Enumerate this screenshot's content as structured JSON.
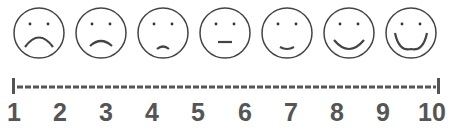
{
  "colors": {
    "stroke": "#444444",
    "line": "#555555",
    "numbers": "#555555",
    "background": "#ffffff"
  },
  "faces": [
    {
      "name": "very-sad-face",
      "mouth": "deep-frown"
    },
    {
      "name": "sad-face",
      "mouth": "frown"
    },
    {
      "name": "slightly-sad-face",
      "mouth": "small-frown"
    },
    {
      "name": "neutral-face",
      "mouth": "flat"
    },
    {
      "name": "slightly-happy-face",
      "mouth": "small-smile"
    },
    {
      "name": "happy-face",
      "mouth": "smile"
    },
    {
      "name": "very-happy-face",
      "mouth": "big-smile"
    }
  ],
  "scale": {
    "min": 1,
    "max": 10,
    "labels": [
      "1",
      "2",
      "3",
      "4",
      "5",
      "6",
      "7",
      "8",
      "9",
      "10"
    ]
  }
}
